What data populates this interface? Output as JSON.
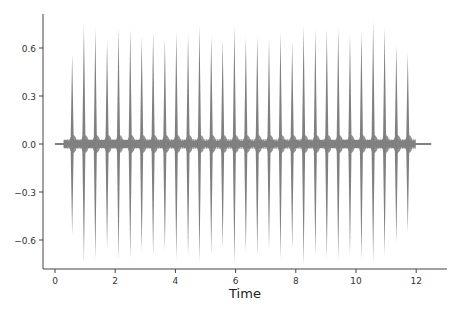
{
  "chart_data": {
    "type": "line",
    "title": "",
    "xlabel": "Time",
    "ylabel": "",
    "xlim": [
      -0.4,
      12.9
    ],
    "ylim": [
      -0.78,
      0.8
    ],
    "xticks": [
      0,
      2,
      4,
      6,
      8,
      10,
      12
    ],
    "xtick_labels": [
      "0",
      "2",
      "4",
      "6",
      "8",
      "10",
      "12"
    ],
    "yticks": [
      0.6,
      0.3,
      0.0,
      -0.3,
      -0.6
    ],
    "ytick_labels": [
      "0.6",
      "0.3",
      "0.0",
      "−0.3",
      "−0.6"
    ],
    "grid": false,
    "legend": null,
    "series": [
      {
        "name": "waveform",
        "color": "#808080",
        "signal_start": 0.0,
        "signal_end": 12.5,
        "baseline_noise": 0.03,
        "peak_times": [
          0.57,
          0.96,
          1.34,
          1.73,
          2.11,
          2.5,
          2.88,
          3.26,
          3.65,
          4.03,
          4.42,
          4.8,
          5.19,
          5.57,
          5.96,
          6.34,
          6.72,
          7.11,
          7.49,
          7.88,
          8.26,
          8.65,
          9.03,
          9.41,
          9.8,
          10.18,
          10.57,
          10.95,
          11.34,
          11.72
        ],
        "peak_pos": [
          0.56,
          0.75,
          0.72,
          0.65,
          0.73,
          0.72,
          0.67,
          0.7,
          0.66,
          0.7,
          0.69,
          0.74,
          0.68,
          0.66,
          0.74,
          0.67,
          0.68,
          0.66,
          0.7,
          0.64,
          0.74,
          0.72,
          0.72,
          0.73,
          0.69,
          0.71,
          0.77,
          0.73,
          0.62,
          0.57
        ],
        "peak_neg": [
          -0.57,
          -0.74,
          -0.72,
          -0.66,
          -0.73,
          -0.72,
          -0.68,
          -0.7,
          -0.67,
          -0.72,
          -0.7,
          -0.74,
          -0.69,
          -0.66,
          -0.75,
          -0.68,
          -0.7,
          -0.66,
          -0.72,
          -0.66,
          -0.76,
          -0.7,
          -0.72,
          -0.73,
          -0.7,
          -0.73,
          -0.74,
          -0.7,
          -0.62,
          -0.55
        ]
      }
    ]
  }
}
